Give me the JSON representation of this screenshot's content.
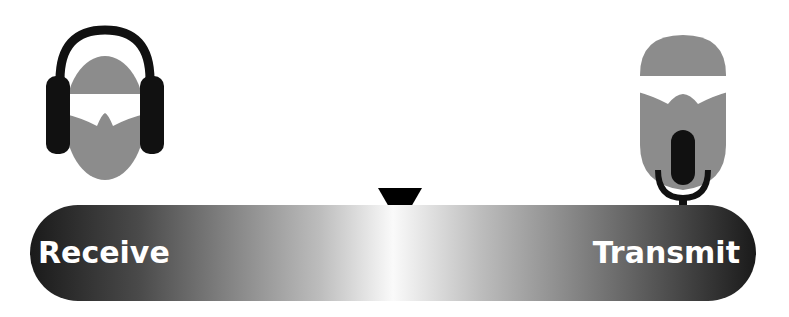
{
  "diagram": {
    "left_figure": {
      "icon": "person-with-headphones-icon",
      "role": "listener"
    },
    "right_figure": {
      "icon": "person-with-microphone-icon",
      "role": "speaker"
    },
    "slider": {
      "left_label": "Receive",
      "right_label": "Transmit",
      "indicator_position": "center",
      "indicator_icon": "down-triangle-icon"
    },
    "colors": {
      "head": "#8c8c8c",
      "dark": "#111111",
      "background": "#ffffff"
    }
  }
}
